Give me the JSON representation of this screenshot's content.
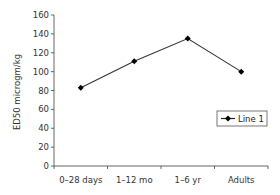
{
  "chart_data": {
    "type": "line",
    "title": "",
    "xlabel": "",
    "ylabel": "ED50 microgm/kg",
    "categories": [
      "0-28 days",
      "1-12 mo",
      "1-6 yr",
      "Adults"
    ],
    "series": [
      {
        "name": "Line 1",
        "values": [
          83,
          111,
          135,
          100
        ],
        "color": "#000000",
        "marker": "diamond"
      }
    ],
    "ylim": [
      0,
      160
    ],
    "yticks": [
      0,
      20,
      40,
      60,
      80,
      100,
      120,
      140,
      160
    ],
    "grid": false,
    "legend_position": "right-middle"
  },
  "legend": {
    "label": "Line 1"
  },
  "colors": {
    "line": "#333333",
    "axis": "#555555",
    "text": "#333333"
  }
}
